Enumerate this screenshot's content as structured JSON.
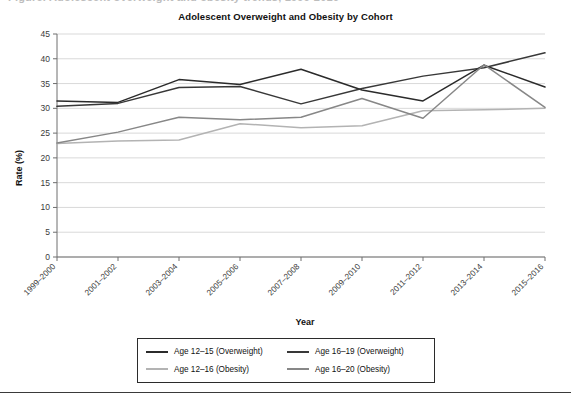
{
  "page": {
    "clipped_header_text": "Figure. Adolescent overweight and obesity trends, 1999-2016"
  },
  "chart_data": {
    "type": "line",
    "title": "Adolescent Overweight and Obesity by Cohort",
    "xlabel": "Year",
    "ylabel": "Rate (%)",
    "ylim": [
      0,
      45
    ],
    "ytick_step": 5,
    "yticks": [
      "0",
      "5",
      "10",
      "15",
      "20",
      "25",
      "30",
      "35",
      "40",
      "45"
    ],
    "grid": true,
    "legend_position": "bottom-center",
    "categories": [
      "1999–2000",
      "2001–2002",
      "2003–2004",
      "2005–2006",
      "2007–2008",
      "2009–2010",
      "2011–2012",
      "2013–2014",
      "2015–2016"
    ],
    "series": [
      {
        "name": "Age 12–15 (Overweight)",
        "color": "#2b2b2b",
        "values": [
          31.5,
          31.2,
          35.8,
          34.8,
          37.9,
          33.7,
          31.5,
          38.7,
          34.3
        ]
      },
      {
        "name": "Age 16–19 (Overweight)",
        "color": "#383838",
        "values": [
          30.4,
          31.0,
          34.2,
          34.4,
          30.9,
          34.0,
          36.5,
          38.2,
          41.2
        ]
      },
      {
        "name": "Age 12–16 (Obesity)",
        "color": "#b3b3b3",
        "values": [
          22.9,
          23.4,
          23.6,
          26.9,
          26.1,
          26.5,
          29.5,
          29.7,
          30.0
        ]
      },
      {
        "name": "Age 16–20 (Obesity)",
        "color": "#878787",
        "values": [
          23.0,
          25.2,
          28.2,
          27.7,
          28.2,
          32.0,
          28.0,
          38.8,
          30.2
        ]
      }
    ]
  },
  "legend": {
    "items": [
      {
        "label": "Age 12–15 (Overweight)",
        "color": "#2b2b2b"
      },
      {
        "label": "Age 16–19 (Overweight)",
        "color": "#383838"
      },
      {
        "label": "Age 12–16 (Obesity)",
        "color": "#b3b3b3"
      },
      {
        "label": "Age 16–20 (Obesity)",
        "color": "#878787"
      }
    ]
  }
}
